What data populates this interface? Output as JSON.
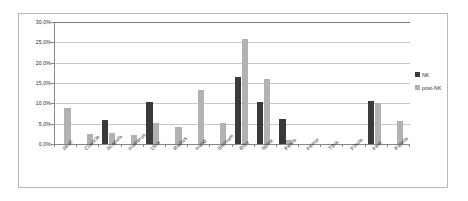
{
  "chart_data": {
    "type": "bar",
    "title": "",
    "xlabel": "",
    "ylabel": "",
    "ylim": [
      0,
      30
    ],
    "grid": true,
    "legend_position": "right",
    "ytick_labels": [
      "30,0%",
      "25,0%",
      "20,0%",
      "15,0%",
      "10,0%",
      "5,0%",
      "0,0%"
    ],
    "ytick_values": [
      30,
      25,
      20,
      15,
      10,
      5,
      0
    ],
    "categories": [
      "Skull",
      "Clavicle",
      "Scapula",
      "Humerus",
      "Ulna",
      "Radius",
      "Hand",
      "Sternum",
      "Ribs",
      "Spine",
      "Pelvis",
      "Femur",
      "Tibia",
      "Fibula",
      "Feet",
      "Patella"
    ],
    "series": [
      {
        "name": "NK",
        "color": "#3a3a3a",
        "values": [
          0,
          0,
          6.0,
          0,
          10.4,
          0,
          0,
          0,
          16.4,
          10.3,
          6.2,
          0,
          0,
          0,
          10.7,
          0
        ]
      },
      {
        "name": "post-NK",
        "color": "#b2b2b2",
        "values": [
          8.9,
          2.5,
          2.7,
          2.3,
          5.1,
          4.1,
          13.3,
          5.1,
          25.8,
          15.9,
          1.1,
          0,
          0,
          0,
          10.2,
          5.7
        ]
      }
    ]
  },
  "legend": {
    "items": [
      {
        "label": "NK"
      },
      {
        "label": "post-NK"
      }
    ]
  }
}
